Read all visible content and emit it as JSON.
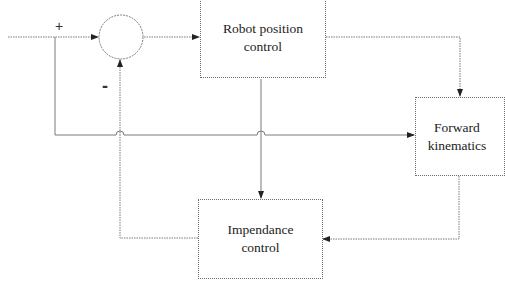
{
  "diagram": {
    "type": "control-block-diagram",
    "blocks": {
      "robot_position": {
        "line1": "Robot position",
        "line2": "control"
      },
      "forward_kinematics": {
        "line1": "Forward",
        "line2": "kinematics"
      },
      "impedance": {
        "line1": "Impendance",
        "line2": "control"
      }
    },
    "summing_junction": {
      "plus_sign": "+",
      "minus_sign": "-"
    },
    "colors": {
      "line": "#6a6a6a",
      "text": "#222222",
      "background": "#ffffff"
    }
  }
}
